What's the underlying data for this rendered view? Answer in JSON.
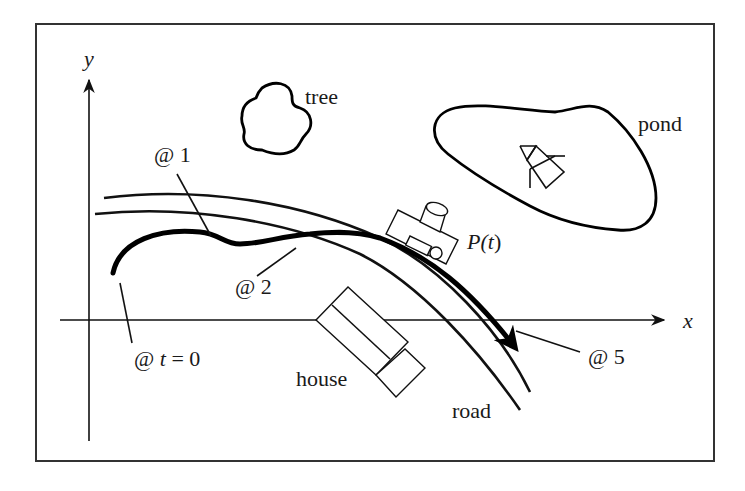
{
  "figure": {
    "frame_color": "#333333",
    "ink_color": "#111111",
    "background": "#ffffff"
  },
  "axes": {
    "x_label": "x",
    "y_label": "y"
  },
  "landmarks": {
    "tree": "tree",
    "pond": "pond",
    "house": "house",
    "road": "road"
  },
  "path": {
    "label": "P(t)",
    "label_prefix": "P(",
    "label_var": "t",
    "label_suffix": ")"
  },
  "time_markers": [
    {
      "id": "t0",
      "prefix": "@ ",
      "var": "t",
      "suffix": " = 0"
    },
    {
      "id": "t1",
      "text": "@ 1"
    },
    {
      "id": "t2",
      "text": "@ 2"
    },
    {
      "id": "t5",
      "text": "@ 5"
    }
  ]
}
